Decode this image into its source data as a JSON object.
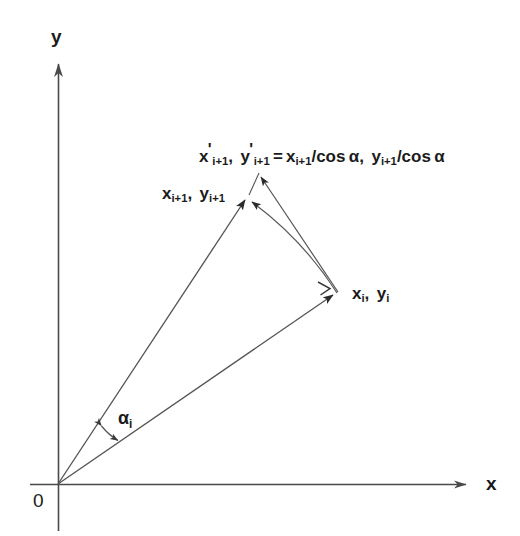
{
  "figure": {
    "background_color": "#ffffff",
    "ink_color": "#2b2b2b",
    "text_color": "#1b1b1b",
    "width": 520,
    "height": 536
  },
  "axes": {
    "y_label": "y",
    "x_label": "x",
    "origin_label": "0",
    "origin": {
      "x": 58,
      "y": 484
    },
    "x_axis": {
      "x1": 30,
      "y1": 484,
      "x2": 472,
      "y2": 484
    },
    "y_axis": {
      "x1": 58,
      "y1": 530,
      "x2": 58,
      "y2": 58
    }
  },
  "points": {
    "xi": {
      "x": 337,
      "y": 292,
      "label_parts": {
        "x": "x",
        "xsub": "i",
        "sep": ", ",
        "y": "y",
        "ysub": "i"
      }
    },
    "xi1": {
      "x": 248,
      "y": 196,
      "label_parts": {
        "x": "x",
        "xsub": "i+1",
        "sep": ", ",
        "y": "y",
        "ysub": "i+1"
      }
    },
    "xi1_prime": {
      "x": 258,
      "y": 172
    }
  },
  "labels": {
    "point_xi": "x_i, y_i",
    "point_xi1": "x_{i+1}, y_{i+1}",
    "formula": "x'_{i+1}, y'_{i+1} = x_{i+1}/cos α, y_{i+1}/cos α",
    "angle": "α_i"
  },
  "label_tokens": {
    "x": "x",
    "y": "y",
    "sub_i": "i",
    "sub_i1": "i+1",
    "comma": ",",
    "prime": "'",
    "equals": "=",
    "slash_cos_alpha": "/cos α",
    "alpha": "α"
  },
  "angle": {
    "symbol": "α",
    "subscript": "i",
    "description": "angle between the vector to (x_i, y_i) and the vector to (x_{i+1}, y_{i+1})",
    "arc_arrow_start": {
      "x": 100,
      "y": 424
    },
    "arc_arrow_end": {
      "x": 120,
      "y": 442
    }
  },
  "vectors": [
    {
      "name": "vector-to-xi",
      "from": {
        "x": 58,
        "y": 484
      },
      "to": {
        "x": 337,
        "y": 292
      },
      "arrowhead": true
    },
    {
      "name": "vector-to-xi1",
      "from": {
        "x": 58,
        "y": 484
      },
      "to": {
        "x": 248,
        "y": 196
      },
      "arrowhead": true
    },
    {
      "name": "vector-xi-to-xi1-prime",
      "from": {
        "x": 337,
        "y": 292
      },
      "to": {
        "x": 258,
        "y": 172
      },
      "arrowhead": true
    },
    {
      "name": "arc-xi-to-xi1",
      "from": {
        "x": 337,
        "y": 292
      },
      "to": {
        "x": 248,
        "y": 196
      },
      "arrowhead": true
    },
    {
      "name": "segment-xi1-to-xi1-prime",
      "from": {
        "x": 248,
        "y": 196
      },
      "to": {
        "x": 258,
        "y": 172
      },
      "arrowhead": false
    }
  ],
  "tick_marks": [
    {
      "name": "arc-direction-tick",
      "x": 325,
      "y": 287
    }
  ]
}
